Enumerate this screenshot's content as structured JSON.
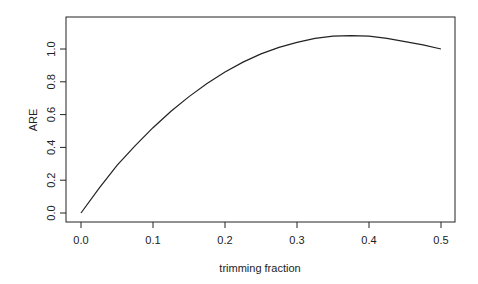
{
  "chart_data": {
    "type": "line",
    "title": "",
    "xlabel": "trimming fraction",
    "ylabel": "ARE",
    "xlim": [
      0.0,
      0.5
    ],
    "ylim": [
      0.0,
      1.1
    ],
    "xticks": [
      "0.0",
      "0.1",
      "0.2",
      "0.3",
      "0.4",
      "0.5"
    ],
    "yticks": [
      "0.0",
      "0.2",
      "0.4",
      "0.6",
      "0.8",
      "1.0"
    ],
    "grid": false,
    "legend": null,
    "series": [
      {
        "name": "ARE",
        "color": "#222222",
        "x": [
          0.0,
          0.025,
          0.05,
          0.075,
          0.1,
          0.125,
          0.15,
          0.175,
          0.2,
          0.225,
          0.25,
          0.275,
          0.3,
          0.325,
          0.35,
          0.375,
          0.4,
          0.425,
          0.45,
          0.475,
          0.5
        ],
        "y": [
          0.0,
          0.15,
          0.29,
          0.41,
          0.52,
          0.62,
          0.71,
          0.79,
          0.86,
          0.92,
          0.97,
          1.01,
          1.04,
          1.065,
          1.078,
          1.082,
          1.078,
          1.065,
          1.045,
          1.025,
          1.0
        ]
      }
    ]
  }
}
